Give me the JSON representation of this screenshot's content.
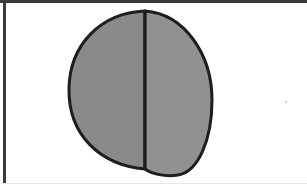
{
  "diagram": {
    "colors": {
      "frame": "#3a3a3a",
      "outline": "#1e1e1e",
      "left_fill": "#8a8a8a",
      "right_fill": "#919191",
      "background": "#ffffff"
    },
    "parts": [
      {
        "name": "left-half",
        "fill": "#8a8a8a"
      },
      {
        "name": "right-half",
        "fill": "#919191"
      }
    ]
  }
}
